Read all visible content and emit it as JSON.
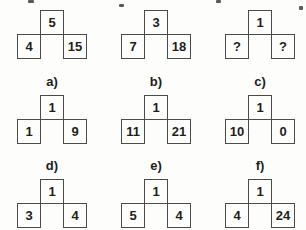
{
  "puzzle": {
    "description": "number box puzzle",
    "question_figures": [
      {
        "top": "5",
        "bottom_left": "4",
        "bottom_right": "15"
      },
      {
        "top": "3",
        "bottom_left": "7",
        "bottom_right": "18"
      },
      {
        "top": "1",
        "bottom_left": "?",
        "bottom_right": "?"
      }
    ],
    "option_figures": [
      {
        "label": "a)",
        "top": "1",
        "bottom_left": "1",
        "bottom_right": "9"
      },
      {
        "label": "b)",
        "top": "1",
        "bottom_left": "11",
        "bottom_right": "21"
      },
      {
        "label": "c)",
        "top": "1",
        "bottom_left": "10",
        "bottom_right": "0"
      },
      {
        "label": "d)",
        "top": "1",
        "bottom_left": "3",
        "bottom_right": "4"
      },
      {
        "label": "e)",
        "top": "1",
        "bottom_left": "5",
        "bottom_right": "4"
      },
      {
        "label": "f)",
        "top": "1",
        "bottom_left": "4",
        "bottom_right": "24"
      }
    ]
  },
  "colors": {
    "line": "#4a4a4a",
    "text": "#1d1d1d",
    "background": "#fdfdfc"
  }
}
